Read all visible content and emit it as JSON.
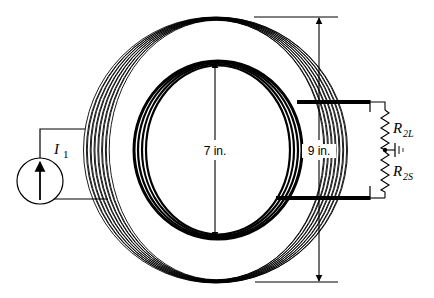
{
  "diagram": {
    "source": {
      "label": "I",
      "subscript": "1",
      "icon": "current-source-arrow-up"
    },
    "inner_coil": {
      "dimension_label": "7 in."
    },
    "outer_coil": {
      "dimension_label": "9 in."
    },
    "resistors": [
      {
        "label": "R",
        "subscript": "2L"
      },
      {
        "label": "R",
        "subscript": "2S"
      }
    ],
    "ground_symbol": "ground-icon",
    "colors": {
      "ink": "#000000",
      "background": "#ffffff"
    }
  }
}
